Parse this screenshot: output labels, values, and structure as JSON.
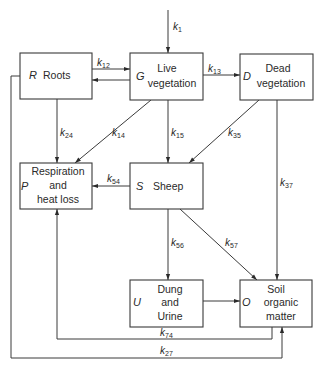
{
  "diagram": {
    "boxes": {
      "roots": {
        "letter": "R",
        "lines": [
          "Roots"
        ]
      },
      "live": {
        "letter": "G",
        "lines": [
          "Live",
          "vegetation"
        ]
      },
      "dead": {
        "letter": "D",
        "lines": [
          "Dead",
          "vegetation"
        ]
      },
      "resp": {
        "letter": "P",
        "lines": [
          "Respiration",
          "and",
          "heat loss"
        ]
      },
      "sheep": {
        "letter": "S",
        "lines": [
          "Sheep"
        ]
      },
      "dung": {
        "letter": "U",
        "lines": [
          "Dung",
          "and",
          "Urine"
        ]
      },
      "soil": {
        "letter": "O",
        "lines": [
          "Soil",
          "organic",
          "matter"
        ]
      }
    },
    "rates": {
      "k1": {
        "k": "k",
        "sub": "1"
      },
      "k12": {
        "k": "k",
        "sub": "12"
      },
      "k13": {
        "k": "k",
        "sub": "13"
      },
      "k24": {
        "k": "k",
        "sub": "24"
      },
      "k14": {
        "k": "k",
        "sub": "14"
      },
      "k15": {
        "k": "k",
        "sub": "15"
      },
      "k35": {
        "k": "k",
        "sub": "35"
      },
      "k37": {
        "k": "k",
        "sub": "37"
      },
      "k54": {
        "k": "k",
        "sub": "54"
      },
      "k56": {
        "k": "k",
        "sub": "56"
      },
      "k57": {
        "k": "k",
        "sub": "57"
      },
      "k74": {
        "k": "k",
        "sub": "74"
      },
      "k27": {
        "k": "k",
        "sub": "27"
      }
    },
    "colors": {
      "stroke": "#3a3a3a",
      "text": "#2a2a2a",
      "background": "#ffffff"
    }
  }
}
